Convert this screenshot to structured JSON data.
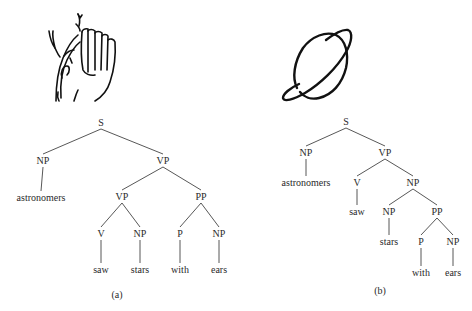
{
  "figure": {
    "trees": [
      {
        "id": "a",
        "caption": "(a)",
        "icon": "ear-listening-icon",
        "nodes": [
          {
            "id": "S",
            "label": "S"
          },
          {
            "id": "NP1",
            "label": "NP",
            "parent": "S"
          },
          {
            "id": "VP1",
            "label": "VP",
            "parent": "S"
          },
          {
            "id": "w_astronomers",
            "label": "astronomers",
            "parent": "NP1"
          },
          {
            "id": "VP2",
            "label": "VP",
            "parent": "VP1"
          },
          {
            "id": "PP",
            "label": "PP",
            "parent": "VP1"
          },
          {
            "id": "V",
            "label": "V",
            "parent": "VP2"
          },
          {
            "id": "NP2",
            "label": "NP",
            "parent": "VP2"
          },
          {
            "id": "P",
            "label": "P",
            "parent": "PP"
          },
          {
            "id": "NP3",
            "label": "NP",
            "parent": "PP"
          },
          {
            "id": "w_saw",
            "label": "saw",
            "parent": "V"
          },
          {
            "id": "w_stars",
            "label": "stars",
            "parent": "NP2"
          },
          {
            "id": "w_with",
            "label": "with",
            "parent": "P"
          },
          {
            "id": "w_ears",
            "label": "ears",
            "parent": "NP3"
          }
        ]
      },
      {
        "id": "b",
        "caption": "(b)",
        "icon": "planet-saturn-icon",
        "nodes": [
          {
            "id": "S",
            "label": "S"
          },
          {
            "id": "NP1",
            "label": "NP",
            "parent": "S"
          },
          {
            "id": "VP",
            "label": "VP",
            "parent": "S"
          },
          {
            "id": "w_astronomers",
            "label": "astronomers",
            "parent": "NP1"
          },
          {
            "id": "V",
            "label": "V",
            "parent": "VP"
          },
          {
            "id": "NP2",
            "label": "NP",
            "parent": "VP"
          },
          {
            "id": "w_saw",
            "label": "saw",
            "parent": "V"
          },
          {
            "id": "NP3",
            "label": "NP",
            "parent": "NP2"
          },
          {
            "id": "PP",
            "label": "PP",
            "parent": "NP2"
          },
          {
            "id": "w_stars",
            "label": "stars",
            "parent": "NP3"
          },
          {
            "id": "P",
            "label": "P",
            "parent": "PP"
          },
          {
            "id": "NP4",
            "label": "NP",
            "parent": "PP"
          },
          {
            "id": "w_with",
            "label": "with",
            "parent": "P"
          },
          {
            "id": "w_ears",
            "label": "ears",
            "parent": "NP4"
          }
        ]
      }
    ]
  }
}
